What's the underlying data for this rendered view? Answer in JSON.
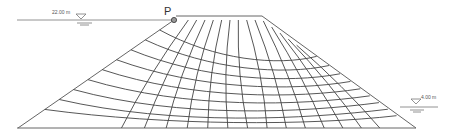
{
  "diagram": {
    "type": "flow-net-earth-dam",
    "upstream_water_level": "22.00 m",
    "downstream_water_level": "4.00 m",
    "point_label": "P",
    "colors": {
      "line": "#555555",
      "grid": "#444444",
      "background": "#ffffff"
    }
  }
}
